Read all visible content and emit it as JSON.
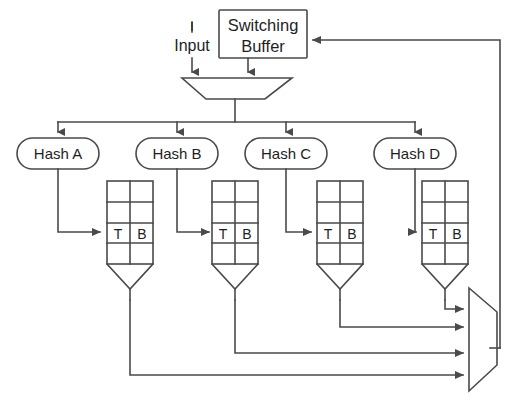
{
  "diagram": {
    "stroke_color": "#4a4a4a",
    "text_color": "#1e1e1e",
    "background": "#ffffff"
  },
  "input": {
    "label": "Input",
    "tick": "l"
  },
  "switching_buffer": {
    "line1": "Switching",
    "line2": "Buffer"
  },
  "hash_nodes": [
    {
      "label": "Hash A"
    },
    {
      "label": "Hash B"
    },
    {
      "label": "Hash C"
    },
    {
      "label": "Hash D"
    }
  ],
  "tables": [
    {
      "cells": {
        "left": "T",
        "right": "B"
      }
    },
    {
      "cells": {
        "left": "T",
        "right": "B"
      }
    },
    {
      "cells": {
        "left": "T",
        "right": "B"
      }
    },
    {
      "cells": {
        "left": "T",
        "right": "B"
      }
    }
  ],
  "cell_labels": {
    "t": "T",
    "b": "B"
  }
}
